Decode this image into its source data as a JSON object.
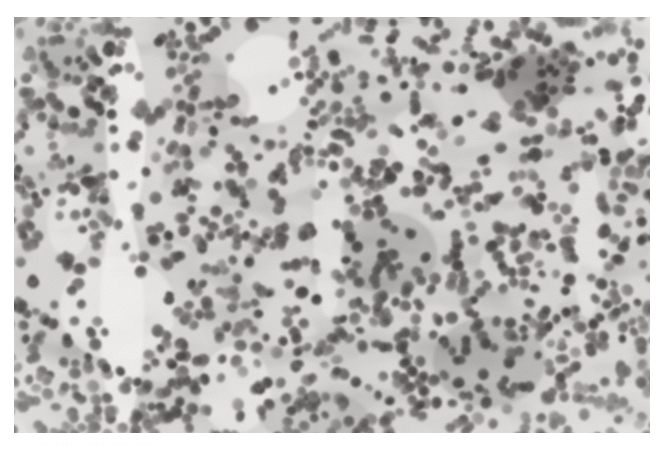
{
  "page": {
    "background_color": "#ffffff",
    "width": 664,
    "height": 451,
    "top_text_remnant": "· · ·· · · ·· · · · ·· · · · · ·· · · ·· · · · · ·· · · · ·· · ·· · · · ·· · · · ·",
    "bottom_text_remnant": "· · · · ·· · · · · ·· · · · ·· · · · ·· · ·"
  },
  "figure": {
    "name": "histopathology-micrograph",
    "modality": "light microscopy",
    "stain": "hematoxylin and eosin",
    "rendering": "grayscale",
    "x": 14,
    "y": 17,
    "width": 636,
    "height": 416,
    "caption": "",
    "label": "",
    "scale_bar": "",
    "magnification": ""
  },
  "appearance": {
    "background_tone": "#d8d6d4",
    "nucleus_dark": "#3c3a39",
    "nucleus_mid": "#6e6b69",
    "nucleus_light": "#8f8c8a",
    "cytoplasm_pale": "#eceae8",
    "stroma_pale": "#f4f3f2",
    "darkest_patch": "#262423",
    "vignette_edge": "#c6c4c2"
  },
  "tissue_structure": {
    "description": "Sheets of densely packed small round-to-oval hyperchromatic nuclei with scant cytoplasm, separated by thin pale fibrovascular septa and clear channels.",
    "nucleus_diameter_px": [
      9,
      13
    ],
    "nucleus_count_approx": 1450,
    "pale_channels": [
      {
        "name": "vertical-septum-left",
        "x": 95,
        "y": 18,
        "width": 34,
        "height": 398,
        "orientation": "vertical"
      },
      {
        "name": "pale-field-upper-middle",
        "x": 216,
        "y": 20,
        "width": 74,
        "height": 92,
        "orientation": "irregular"
      },
      {
        "name": "pale-field-center-left",
        "x": 46,
        "y": 238,
        "width": 116,
        "height": 106,
        "orientation": "irregular"
      },
      {
        "name": "diagonal-septum-center",
        "x": 300,
        "y": 120,
        "width": 30,
        "height": 180,
        "orientation": "diagonal"
      },
      {
        "name": "pale-channel-right",
        "x": 560,
        "y": 150,
        "width": 28,
        "height": 150,
        "orientation": "vertical"
      },
      {
        "name": "pale-field-lower-center",
        "x": 186,
        "y": 330,
        "width": 70,
        "height": 86,
        "orientation": "irregular"
      }
    ],
    "dark_clusters": [
      {
        "name": "hyperchromatic-cluster-upper-right",
        "x": 486,
        "y": 36,
        "width": 66,
        "height": 58
      },
      {
        "name": "dark-band-upper-left",
        "x": 20,
        "y": 22,
        "width": 60,
        "height": 46
      },
      {
        "name": "dark-field-center",
        "x": 330,
        "y": 196,
        "width": 90,
        "height": 80
      },
      {
        "name": "dark-field-lower-right",
        "x": 420,
        "y": 300,
        "width": 110,
        "height": 90
      }
    ]
  }
}
